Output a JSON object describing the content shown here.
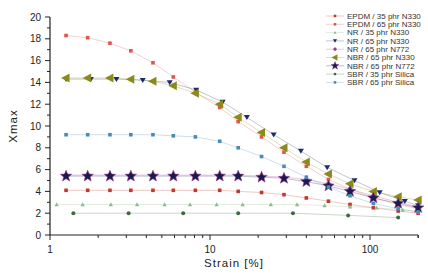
{
  "chart_data": {
    "type": "scatter",
    "title": "",
    "xlabel": "Strain [%]",
    "ylabel": "Xmax",
    "xscale": "log",
    "xlim": [
      1,
      200
    ],
    "ylim": [
      0,
      20
    ],
    "xticks": [
      "1",
      "10",
      "100"
    ],
    "yticks": [
      "0",
      "2",
      "4",
      "6",
      "8",
      "10",
      "12",
      "14",
      "16",
      "18",
      "20"
    ],
    "grid": false,
    "legend_position": "upper right",
    "series": [
      {
        "name": "EPDM / 35 phr N330",
        "color": "#c0392b",
        "marker": "square",
        "x": [
          1.26,
          1.72,
          2.37,
          3.2,
          4.4,
          5.9,
          8.1,
          11.5,
          15,
          21,
          29,
          40,
          55,
          75,
          105,
          150,
          200
        ],
        "y": [
          4.1,
          4.1,
          4.1,
          4.1,
          4.1,
          4.1,
          4.1,
          4.1,
          4.0,
          3.9,
          3.7,
          3.4,
          3.1,
          2.8,
          2.5,
          2.2,
          2.0
        ]
      },
      {
        "name": "EPDM / 65 phr N330",
        "color": "#e0554a",
        "marker": "square",
        "x": [
          1.26,
          1.72,
          2.37,
          3.2,
          4.4,
          5.9,
          8.1,
          11.5,
          15,
          21,
          29,
          40,
          55,
          75,
          105,
          150,
          200
        ],
        "y": [
          18.3,
          18.1,
          17.6,
          16.9,
          15.8,
          14.5,
          13.1,
          11.7,
          10.4,
          9.0,
          7.6,
          6.3,
          5.1,
          4.2,
          3.4,
          2.8,
          2.4
        ]
      },
      {
        "name": "NR / 35 phr N330",
        "color": "#8fbc8f",
        "marker": "triangle-up",
        "x": [
          1.1,
          1.6,
          2.4,
          3.5,
          5.2,
          7.5,
          11,
          16,
          24,
          35,
          52,
          75,
          110,
          160,
          200
        ],
        "y": [
          2.8,
          2.8,
          2.8,
          2.8,
          2.8,
          2.8,
          2.8,
          2.8,
          2.8,
          2.8,
          2.7,
          2.6,
          2.5,
          2.3,
          2.2
        ]
      },
      {
        "name": "NR / 65 phr N330",
        "color": "#1f2a6b",
        "marker": "triangle-down",
        "x": [
          1.26,
          1.8,
          2.6,
          3.8,
          5.6,
          8.2,
          12,
          17,
          25,
          37,
          54,
          80,
          115,
          165,
          200
        ],
        "y": [
          14.3,
          14.3,
          14.3,
          14.2,
          14.0,
          13.3,
          12.2,
          10.8,
          9.2,
          7.7,
          6.2,
          5.0,
          3.9,
          3.1,
          2.7
        ]
      },
      {
        "name": "NR / 65 phr N772",
        "color": "#9b3d8f",
        "marker": "diamond",
        "x": [
          1.26,
          1.72,
          2.37,
          3.2,
          4.4,
          5.9,
          8.1,
          11.5,
          15,
          21,
          29,
          40,
          55,
          75,
          105,
          150,
          200
        ],
        "y": [
          5.5,
          5.5,
          5.5,
          5.5,
          5.5,
          5.5,
          5.5,
          5.5,
          5.5,
          5.4,
          5.3,
          5.1,
          4.7,
          4.2,
          3.6,
          3.0,
          2.6
        ]
      },
      {
        "name": "NBR / 65 phr N330",
        "color": "#8b8b1a",
        "marker": "triangle-left",
        "x": [
          1.26,
          1.72,
          2.37,
          3.2,
          4.4,
          5.9,
          8.1,
          11.5,
          15,
          21,
          29,
          40,
          55,
          75,
          105,
          150,
          200
        ],
        "y": [
          14.4,
          14.4,
          14.4,
          14.3,
          14.1,
          13.7,
          13.0,
          12.0,
          10.8,
          9.4,
          8.0,
          6.7,
          5.6,
          4.7,
          4.0,
          3.5,
          3.2
        ]
      },
      {
        "name": "NBR / 65 phr N772",
        "color": "#1a1a4d",
        "marker": "star",
        "x": [
          1.26,
          1.72,
          2.37,
          3.2,
          4.4,
          5.9,
          8.1,
          11.5,
          15,
          21,
          29,
          40,
          55,
          75,
          105,
          150,
          200
        ],
        "y": [
          5.4,
          5.4,
          5.4,
          5.4,
          5.4,
          5.4,
          5.4,
          5.4,
          5.4,
          5.3,
          5.2,
          4.9,
          4.5,
          4.0,
          3.4,
          2.9,
          2.5
        ]
      },
      {
        "name": "SBR / 35 phr Silica",
        "color": "#3d6b3d",
        "marker": "circle",
        "x": [
          1.4,
          3.1,
          6.8,
          15,
          33,
          73,
          150
        ],
        "y": [
          2.0,
          2.0,
          2.0,
          2.0,
          2.0,
          1.8,
          1.6
        ]
      },
      {
        "name": "SBR / 65 phr Silica",
        "color": "#4a8ab8",
        "marker": "square",
        "x": [
          1.26,
          1.72,
          2.37,
          3.2,
          4.4,
          5.9,
          8.1,
          11.5,
          15,
          21,
          29,
          40,
          55,
          75,
          105,
          150,
          200
        ],
        "y": [
          9.2,
          9.2,
          9.2,
          9.2,
          9.2,
          9.1,
          9.0,
          8.6,
          8.0,
          7.2,
          6.3,
          5.3,
          4.4,
          3.6,
          2.9,
          2.4,
          2.1
        ]
      }
    ]
  }
}
